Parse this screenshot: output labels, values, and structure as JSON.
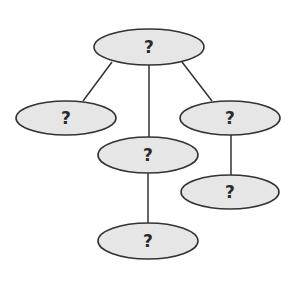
{
  "diagram": {
    "type": "tree",
    "colors": {
      "node_fill": "#e6e6e6",
      "node_stroke": "#333333",
      "edge": "#333333",
      "text": "#2a2a2a"
    },
    "nodes": [
      {
        "id": "root",
        "label": "?",
        "cx": 149,
        "cy": 47,
        "rx": 55,
        "ry": 18
      },
      {
        "id": "left",
        "label": "?",
        "cx": 66,
        "cy": 118,
        "rx": 50,
        "ry": 17
      },
      {
        "id": "middle",
        "label": "?",
        "cx": 148,
        "cy": 155,
        "rx": 50,
        "ry": 18
      },
      {
        "id": "right",
        "label": "?",
        "cx": 230,
        "cy": 118,
        "rx": 50,
        "ry": 17
      },
      {
        "id": "right-child",
        "label": "?",
        "cx": 230,
        "cy": 192,
        "rx": 49,
        "ry": 17
      },
      {
        "id": "bottom",
        "label": "?",
        "cx": 148,
        "cy": 241,
        "rx": 50,
        "ry": 18
      }
    ],
    "edges": [
      {
        "from": "root",
        "to": "left"
      },
      {
        "from": "root",
        "to": "middle"
      },
      {
        "from": "root",
        "to": "right"
      },
      {
        "from": "middle",
        "to": "bottom"
      },
      {
        "from": "right",
        "to": "right-child"
      }
    ]
  }
}
